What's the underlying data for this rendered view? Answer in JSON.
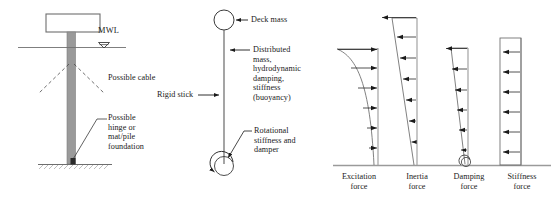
{
  "figure": {
    "background": "#ffffff",
    "stroke_dark": "#1a1a1a",
    "stroke_gray": "#8a8a8a",
    "column_fill": "#9a9a9a",
    "deck_fill": "#ffffff"
  },
  "panel_left": {
    "name": "physical-structure",
    "labels": {
      "mwl": "MWL",
      "possible_cable": "Possible cable",
      "possible_foundation": "Possible\nhinge or\nmat/pile\nfoundation"
    },
    "elements": {
      "deck": "deck-box",
      "column": "gravity-column",
      "waterline": "mean-water-level-line",
      "cables": "dashed-cable-lines",
      "seabed": "hatched-seabed-line",
      "mwl_symbol": "water-level-triangle"
    }
  },
  "panel_middle": {
    "name": "idealised-stick-model",
    "labels": {
      "deck_mass": "Deck mass",
      "distributed": "Distributed\nmass,\nhydrodynamic\ndamping,\nstiffness\n(buoyancy)",
      "rigid_stick": "Rigid stick",
      "rotational": "Rotational\nstiffness and\ndamper"
    },
    "elements": {
      "mass_circle": "deck-mass-circle",
      "stick": "rigid-stick-line",
      "base_circle": "rotational-spring-circle",
      "base_arc": "rotational-arc-arrow"
    }
  },
  "panel_right": {
    "name": "force-distribution-diagrams",
    "baseline": "ground-baseline",
    "diagrams": [
      {
        "id": "excitation",
        "label": "Excitation\nforce",
        "profile": "concave",
        "direction": "right",
        "arrow_count": 6,
        "max_at": "top",
        "relative_magnitudes": [
          1.0,
          0.62,
          0.4,
          0.27,
          0.18,
          0.13
        ]
      },
      {
        "id": "inertia",
        "label": "Inertia\nforce",
        "profile": "linear-triangular",
        "direction": "left",
        "arrow_count": 7,
        "max_at": "top",
        "relative_magnitudes": [
          1.0,
          0.84,
          0.69,
          0.54,
          0.38,
          0.23,
          0.08
        ]
      },
      {
        "id": "damping",
        "label": "Damping\nforce",
        "profile": "linear-triangular-narrow",
        "direction": "left",
        "arrow_count": 6,
        "max_at": "top",
        "relative_magnitudes": [
          1.0,
          0.83,
          0.66,
          0.5,
          0.33,
          0.17
        ],
        "has_base_circle": true
      },
      {
        "id": "stiffness",
        "label": "Stiffness\nforce",
        "profile": "uniform-rectangular",
        "direction": "left",
        "arrow_count": 6,
        "max_at": "uniform",
        "relative_magnitudes": [
          1.0,
          1.0,
          1.0,
          1.0,
          1.0,
          1.0
        ]
      }
    ]
  }
}
